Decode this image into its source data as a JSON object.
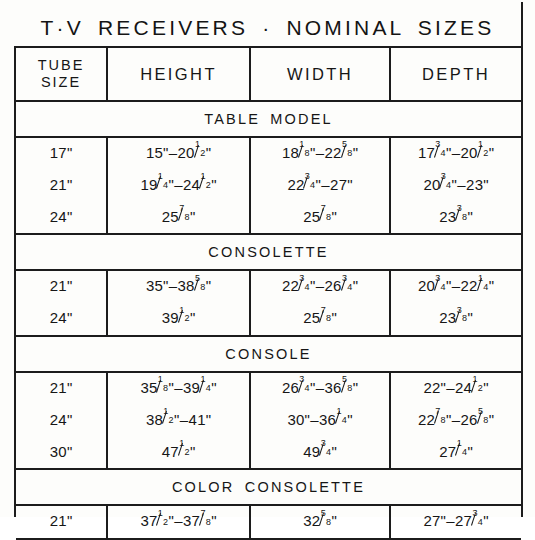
{
  "document": {
    "title": "T·V RECEIVERS · NOMINAL SIZES"
  },
  "table": {
    "columns": [
      {
        "key": "tube",
        "label_line1": "TUBE",
        "label_line2": "SIZE"
      },
      {
        "key": "height",
        "label": "HEIGHT"
      },
      {
        "key": "width",
        "label": "WIDTH"
      },
      {
        "key": "depth",
        "label": "DEPTH"
      }
    ],
    "sections": [
      {
        "band_label": "TABLE MODEL",
        "rows": [
          {
            "tube": "17\"",
            "height": "15\"–20½\"",
            "width": "18⅛\"–22⅝\"",
            "depth": "17¾\"–20½\""
          },
          {
            "tube": "21\"",
            "height": "19¼\"–24½\"",
            "width": "22¾\"–27\"",
            "depth": "20¾\"–23\""
          },
          {
            "tube": "24\"",
            "height": "25⅞\"",
            "width": "25⅞\"",
            "depth": "23⅜\""
          }
        ]
      },
      {
        "band_label": "CONSOLETTE",
        "rows": [
          {
            "tube": "21\"",
            "height": "35\"–38⅝\"",
            "width": "22¾\"–26¾\"",
            "depth": "20¾\"–22¼\""
          },
          {
            "tube": "24\"",
            "height": "39½\"",
            "width": "25⅞\"",
            "depth": "23⅜\""
          }
        ]
      },
      {
        "band_label": "CONSOLE",
        "rows": [
          {
            "tube": "21\"",
            "height": "35⅛\"–39¼\"",
            "width": "26¾\"–36⅝\"",
            "depth": "22\"–24½\""
          },
          {
            "tube": "24\"",
            "height": "38½\"–41\"",
            "width": "30\"–36¼\"",
            "depth": "22⅞\"–26⅝\""
          },
          {
            "tube": "30\"",
            "height": "47½\"",
            "width": "49¾\"",
            "depth": "27¼\""
          }
        ]
      },
      {
        "band_label": "COLOR CONSOLETTE",
        "rows": [
          {
            "tube": "21\"",
            "height": "37½\"–37⅞\"",
            "width": "32⅝\"",
            "depth": "27\"–27¾\""
          }
        ]
      }
    ]
  },
  "colors": {
    "ink": "#1c1c1c",
    "paper": "#fdfdfb"
  }
}
